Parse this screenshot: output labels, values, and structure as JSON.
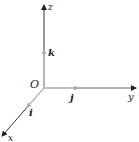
{
  "diagram": {
    "title": "",
    "origin_label": "O",
    "axes": [
      {
        "name": "x",
        "label": "x"
      },
      {
        "name": "y",
        "label": "y"
      },
      {
        "name": "z",
        "label": "z"
      }
    ],
    "unit_vectors": [
      {
        "name": "i",
        "label": "i",
        "axis": "x"
      },
      {
        "name": "j",
        "label": "j",
        "axis": "y"
      },
      {
        "name": "k",
        "label": "k",
        "axis": "z"
      }
    ],
    "colors": {
      "axis": "#333333",
      "unit_vector": "#b8b8b8",
      "label": "#222222"
    }
  }
}
